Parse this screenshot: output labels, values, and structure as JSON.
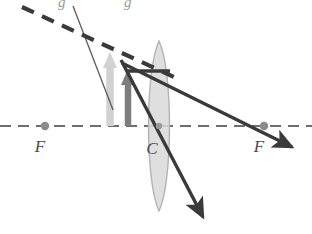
{
  "figure": {
    "type": "optics-ray-diagram",
    "canvas": {
      "width": 312,
      "height": 234,
      "background": "#ffffff"
    },
    "colors": {
      "axis": "#6e6e6e",
      "ray_thick": "#3a3a3a",
      "ray_thin": "#5c5c5c",
      "dashed_ray": "#3a3a3a",
      "object_arrow": "#d0d0d0",
      "image_arrow": "#7a7a7a",
      "lens_fill": "#d9d9d9",
      "lens_stroke": "#b0b0b0",
      "label": "#4a4a4a",
      "focal_dot": "#8a8a8a"
    },
    "labels": {
      "focal_left": "F",
      "focal_right": "F",
      "center": "C",
      "clipped_top_left": "g",
      "clipped_top_right": "g"
    },
    "elements": {
      "optical_axis": {
        "name": "optical-axis",
        "style": "dashed",
        "y": 126,
        "x1": 0,
        "x2": 312
      },
      "lens": {
        "name": "converging-lens",
        "center_x": 159,
        "center_y": 126,
        "half_height": 85,
        "half_width": 14
      },
      "focal_point_left": {
        "x": 45,
        "y": 126
      },
      "focal_point_right": {
        "x": 264,
        "y": 126
      },
      "object_arrow": {
        "name": "object-arrow",
        "x": 110,
        "base_y": 126,
        "tip_y": 54
      },
      "image_arrow": {
        "name": "image-arrow",
        "x": 128,
        "base_y": 126,
        "tip_y": 71
      },
      "ray_parallel": {
        "name": "parallel-ray-horizontal",
        "x1": 128,
        "y1": 71,
        "x2": 167,
        "y2": 71
      },
      "ray_refracted": {
        "name": "refracted-ray-through-focus",
        "x1": 123,
        "y1": 64,
        "x2": 298,
        "y2": 150
      },
      "ray_through_center": {
        "name": "ray-through-center",
        "x1": 122,
        "y1": 61,
        "x2": 208,
        "y2": 225
      },
      "ray_incident_thin": {
        "name": "incident-thin-ray",
        "x1": 73,
        "y1": 7,
        "x2": 112,
        "y2": 108
      },
      "ray_dashed_construction": {
        "name": "dashed-construction-ray",
        "x1": 24,
        "y1": 8,
        "x2": 172,
        "y2": 75
      }
    }
  }
}
